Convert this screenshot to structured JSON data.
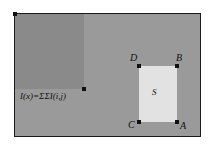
{
  "figure": {
    "colors": {
      "image_background": "#9a9a9a",
      "integral_region": "#8a8a8a",
      "rect_s_fill": "#e2e2e2",
      "stroke": "#111111",
      "page_background": "#ffffff"
    }
  },
  "labels": {
    "formula": "I(x)=ΣΣI(i,j)",
    "region_s": "S",
    "corner_d": "D",
    "corner_b": "B",
    "corner_c": "C",
    "corner_a": "A"
  },
  "points": {
    "origin": "origin-corner-marker",
    "x": "point-x-marker"
  }
}
